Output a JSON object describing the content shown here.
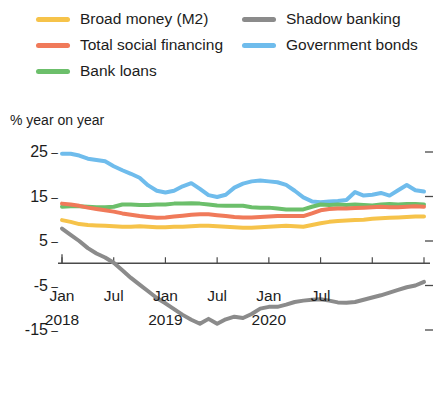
{
  "legend": {
    "columns": [
      {
        "items": [
          {
            "label": "Broad money (M2)",
            "color": "#f6c34a",
            "key": "m2"
          },
          {
            "label": "Total social financing",
            "color": "#f07a5a",
            "key": "tsf"
          },
          {
            "label": "Bank loans",
            "color": "#6cbf6b",
            "key": "loans"
          }
        ]
      },
      {
        "items": [
          {
            "label": "Shadow banking",
            "color": "#8b8b8b",
            "key": "shadow"
          },
          {
            "label": "Government bonds",
            "color": "#6fbcec",
            "key": "govbonds"
          }
        ]
      }
    ]
  },
  "axis_title": "% year on year",
  "chart_data": {
    "type": "line",
    "title": "",
    "subtitle": "",
    "xlabel": "",
    "ylabel": "% year on year",
    "ylim": [
      -20,
      29
    ],
    "xlim": [
      0,
      42
    ],
    "grid": false,
    "zero_line": true,
    "legend_position": "top",
    "ytick_values": [
      25,
      15,
      5,
      -5,
      -15
    ],
    "ytick_labels": [
      "25",
      "15",
      "5",
      "-5",
      "-15"
    ],
    "xtick_positions": [
      0,
      6,
      12,
      18,
      24,
      30,
      36,
      42
    ],
    "xtick_labels": [
      {
        "month": "Jan",
        "year": "2018",
        "index": 0
      },
      {
        "month": "Jul",
        "year": "",
        "index": 6
      },
      {
        "month": "Jan",
        "year": "2019",
        "index": 12
      },
      {
        "month": "Jul",
        "year": "",
        "index": 18
      },
      {
        "month": "Jan",
        "year": "2020",
        "index": 24
      },
      {
        "month": "Jul",
        "year": "",
        "index": 30
      }
    ],
    "x": [
      0,
      1,
      2,
      3,
      4,
      5,
      6,
      7,
      8,
      9,
      10,
      11,
      12,
      13,
      14,
      15,
      16,
      17,
      18,
      19,
      20,
      21,
      22,
      23,
      24,
      25,
      26,
      27,
      28,
      29,
      30,
      31,
      32,
      33,
      34,
      35,
      36,
      37,
      38,
      39,
      40,
      41,
      42
    ],
    "series": [
      {
        "name": "Government bonds",
        "color": "#6fbcec",
        "values": [
          24.6,
          24.6,
          24.2,
          23.5,
          23.2,
          22.9,
          21.8,
          20.9,
          20.1,
          19.2,
          17.5,
          16.3,
          15.9,
          16.3,
          17.3,
          18.0,
          16.7,
          15.3,
          14.9,
          15.4,
          17.0,
          17.9,
          18.4,
          18.6,
          18.4,
          18.2,
          17.6,
          16.3,
          14.8,
          13.9,
          13.7,
          13.9,
          14.0,
          14.2,
          16.0,
          15.2,
          15.4,
          15.8,
          15.2,
          16.4,
          17.6,
          16.4,
          16.1
        ]
      },
      {
        "name": "Bank loans",
        "color": "#6cbf6b",
        "values": [
          12.7,
          12.8,
          12.8,
          12.7,
          12.6,
          12.6,
          12.7,
          13.2,
          13.2,
          13.1,
          13.1,
          13.2,
          13.2,
          13.4,
          13.4,
          13.5,
          13.4,
          13.2,
          13.0,
          12.9,
          12.9,
          12.9,
          12.6,
          12.5,
          12.5,
          12.3,
          12.1,
          12.1,
          12.1,
          12.7,
          13.2,
          13.1,
          13.2,
          13.1,
          13.2,
          13.1,
          13.0,
          13.2,
          13.3,
          13.2,
          13.3,
          13.3,
          13.2
        ]
      },
      {
        "name": "Total social financing",
        "color": "#f07a5a",
        "values": [
          13.4,
          13.2,
          12.9,
          12.5,
          12.2,
          11.9,
          11.6,
          11.2,
          10.9,
          10.6,
          10.4,
          10.2,
          10.3,
          10.5,
          10.7,
          10.9,
          11.0,
          11.0,
          10.8,
          10.6,
          10.4,
          10.3,
          10.3,
          10.4,
          10.5,
          10.6,
          10.6,
          10.6,
          10.6,
          11.2,
          11.9,
          12.2,
          12.3,
          12.3,
          12.4,
          12.5,
          12.6,
          12.7,
          12.6,
          12.6,
          12.7,
          12.8,
          12.7
        ]
      },
      {
        "name": "Broad money (M2)",
        "color": "#f6c34a",
        "values": [
          9.7,
          9.3,
          8.8,
          8.6,
          8.5,
          8.4,
          8.3,
          8.2,
          8.2,
          8.3,
          8.2,
          8.1,
          8.1,
          8.2,
          8.2,
          8.3,
          8.4,
          8.4,
          8.3,
          8.2,
          8.1,
          8.0,
          8.0,
          8.1,
          8.2,
          8.3,
          8.4,
          8.3,
          8.2,
          8.6,
          9.0,
          9.3,
          9.5,
          9.6,
          9.7,
          9.8,
          10.0,
          10.1,
          10.2,
          10.3,
          10.4,
          10.5,
          10.5
        ]
      },
      {
        "name": "Shadow banking",
        "color": "#8b8b8b",
        "values": [
          7.8,
          6.4,
          5.0,
          3.4,
          2.2,
          1.3,
          0.1,
          -1.6,
          -3.3,
          -4.8,
          -6.3,
          -7.8,
          -9.0,
          -10.3,
          -11.6,
          -12.7,
          -13.6,
          -12.5,
          -13.6,
          -12.6,
          -12.0,
          -12.3,
          -11.4,
          -10.2,
          -9.8,
          -9.8,
          -9.3,
          -8.7,
          -8.4,
          -8.2,
          -8.1,
          -8.4,
          -8.8,
          -8.9,
          -8.7,
          -8.2,
          -7.7,
          -7.2,
          -6.6,
          -6.0,
          -5.4,
          -5.0,
          -4.2
        ]
      }
    ]
  }
}
